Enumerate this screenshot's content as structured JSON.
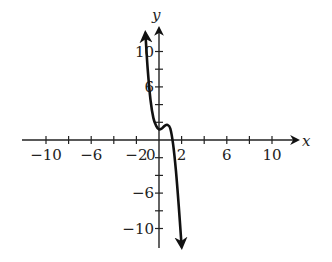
{
  "chart_data": {
    "type": "line",
    "title": "",
    "xlabel": "x",
    "ylabel": "y",
    "xlim": [
      -12,
      12
    ],
    "ylim": [
      -12,
      12
    ],
    "grid": false,
    "x_tick_labels": [
      "-10",
      "-6",
      "-2",
      "0",
      "2",
      "6",
      "10"
    ],
    "y_tick_labels": [
      "10",
      "6",
      "-6",
      "-10"
    ],
    "x_ticks_every": 2,
    "y_ticks_every": 2,
    "series": [
      {
        "name": "curve",
        "x": [
          -1.2,
          -1.0,
          -0.75,
          -0.5,
          -0.25,
          0,
          0.25,
          0.5,
          0.75,
          1.0,
          1.25,
          1.5,
          1.75,
          2.0
        ],
        "y": [
          12,
          8,
          4.5,
          2.5,
          1.6,
          1.2,
          1.3,
          1.6,
          1.7,
          1.3,
          -0.5,
          -3.5,
          -7.5,
          -12
        ],
        "arrows": "both ends"
      }
    ]
  },
  "axis": {
    "x_label": "x",
    "y_label": "y",
    "origin_label": "0",
    "x_labels": [
      {
        "value": -10,
        "text": "−10"
      },
      {
        "value": -6,
        "text": "−6"
      },
      {
        "value": -2,
        "text": "−2"
      },
      {
        "value": 2,
        "text": "2"
      },
      {
        "value": 6,
        "text": "6"
      },
      {
        "value": 10,
        "text": "10"
      }
    ],
    "y_labels": [
      {
        "value": 10,
        "text": "10"
      },
      {
        "value": 6,
        "text": "6"
      },
      {
        "value": -6,
        "text": "−6"
      },
      {
        "value": -10,
        "text": "−10"
      }
    ]
  }
}
